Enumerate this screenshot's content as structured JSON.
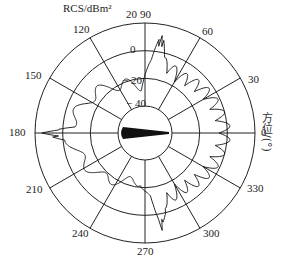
{
  "chart_data": {
    "type": "polar",
    "title": "RCS/dBm²",
    "radial_label": "RCS/dBm²",
    "angular_label": "方位/(°)",
    "radial_ticks": [
      -40,
      -20,
      0,
      20
    ],
    "radial_range": [
      -50,
      20
    ],
    "angular_ticks": [
      0,
      30,
      60,
      90,
      120,
      150,
      180,
      210,
      240,
      270,
      300,
      330
    ],
    "grid": true,
    "series": [
      {
        "name": "RCS pattern",
        "description": "Radar cross-section versus azimuth; strong specular peaks near 180° (~15 dBm²), ~80° and ~280° (~10 dBm²), dense oscillatory lobes from 300° through 0° to 60° (-5 to +5 dBm²), lower scalloped response 100°–260° (about -30 to -10 dBm²)",
        "points": [
          {
            "azimuth": 0,
            "rcs": 3
          },
          {
            "azimuth": 15,
            "rcs": 0
          },
          {
            "azimuth": 30,
            "rcs": -2
          },
          {
            "azimuth": 45,
            "rcs": -5
          },
          {
            "azimuth": 60,
            "rcs": -8
          },
          {
            "azimuth": 75,
            "rcs": -3
          },
          {
            "azimuth": 80,
            "rcs": 12
          },
          {
            "azimuth": 85,
            "rcs": -10
          },
          {
            "azimuth": 95,
            "rcs": -25
          },
          {
            "azimuth": 110,
            "rcs": -22
          },
          {
            "azimuth": 120,
            "rcs": -20
          },
          {
            "azimuth": 135,
            "rcs": -15
          },
          {
            "azimuth": 150,
            "rcs": -12
          },
          {
            "azimuth": 165,
            "rcs": -8
          },
          {
            "azimuth": 175,
            "rcs": -5
          },
          {
            "azimuth": 180,
            "rcs": 15
          },
          {
            "azimuth": 185,
            "rcs": -5
          },
          {
            "azimuth": 195,
            "rcs": -8
          },
          {
            "azimuth": 210,
            "rcs": -12
          },
          {
            "azimuth": 225,
            "rcs": -15
          },
          {
            "azimuth": 240,
            "rcs": -20
          },
          {
            "azimuth": 250,
            "rcs": -22
          },
          {
            "azimuth": 265,
            "rcs": -25
          },
          {
            "azimuth": 275,
            "rcs": -10
          },
          {
            "azimuth": 280,
            "rcs": 12
          },
          {
            "azimuth": 285,
            "rcs": -3
          },
          {
            "azimuth": 300,
            "rcs": -8
          },
          {
            "azimuth": 315,
            "rcs": -5
          },
          {
            "azimuth": 330,
            "rcs": -2
          },
          {
            "azimuth": 345,
            "rcs": 0
          }
        ]
      }
    ]
  },
  "labels": {
    "title": "RCS/dBm²",
    "angular_axis": "方位/(°)",
    "r20": "20",
    "r0": "0",
    "rm20": "− 20",
    "rm40": "− 40",
    "a0": "0",
    "a30": "30",
    "a60": "60",
    "a90": "90",
    "a120": "120",
    "a150": "150",
    "a180": "180",
    "a210": "210",
    "a240": "240",
    "a270": "270",
    "a300": "300",
    "a330": "330"
  }
}
